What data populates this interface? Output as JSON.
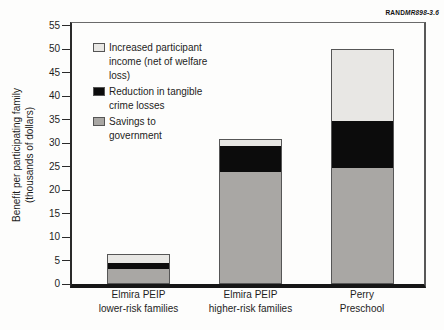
{
  "figure_label": {
    "brand": "RAND",
    "id": "MR898-3.6"
  },
  "chart_data": {
    "type": "bar",
    "stacked": true,
    "title": "",
    "ylabel_lines": [
      "Benefit per participating family",
      "(thousands of dollars)"
    ],
    "xlabel": "",
    "ylim": [
      0,
      55
    ],
    "ytick_step": 5,
    "grid": false,
    "legend_position": "upper-left inside plot area",
    "categories": [
      {
        "lines": [
          "Elmira PEIP",
          "lower-risk families"
        ]
      },
      {
        "lines": [
          "Elmira PEIP",
          "higher-risk families"
        ]
      },
      {
        "lines": [
          "Perry",
          "Preschool"
        ]
      }
    ],
    "series": [
      {
        "name": "Savings to government",
        "color": "#a9a7a4",
        "values": [
          3.2,
          24.0,
          24.7
        ]
      },
      {
        "name": "Reduction in tangible crime losses",
        "color": "#0c0c0c",
        "values": [
          1.2,
          5.6,
          10.0
        ]
      },
      {
        "name": "Increased participant income (net of welfare loss)",
        "color": "#e8e7e4",
        "values": [
          1.9,
          1.2,
          15.3
        ]
      }
    ],
    "totals": [
      6.3,
      30.8,
      50.0
    ],
    "legend": [
      {
        "lines": [
          "Increased participant",
          "income (net of welfare",
          "loss)"
        ],
        "color": "#e8e7e4"
      },
      {
        "lines": [
          "Reduction in tangible",
          "crime losses"
        ],
        "color": "#0c0c0c"
      },
      {
        "lines": [
          "Savings to",
          "government"
        ],
        "color": "#a9a7a4"
      }
    ]
  }
}
